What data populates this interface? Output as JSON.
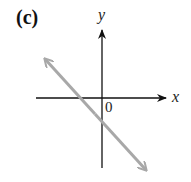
{
  "panel": {
    "label": "(c)"
  },
  "axes": {
    "x_label": "x",
    "y_label": "y",
    "origin_label": "0",
    "axis_color": "#111111"
  },
  "line": {
    "description": "line with negative slope and negative y-intercept, arrows at both ends",
    "color": "#a8a8a8",
    "slope_sign": "negative",
    "y_intercept_sign": "negative",
    "x_intercept_sign": "negative"
  }
}
